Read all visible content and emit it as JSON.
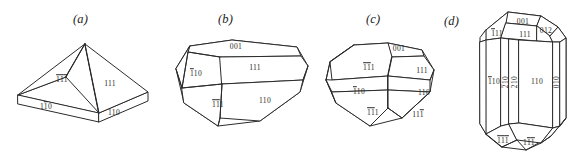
{
  "figure": {
    "background_color": "#ffffff",
    "line_color": "#2b2b2b",
    "text_color": "#2b2b2b",
    "width": 575,
    "height": 159
  },
  "panels": [
    {
      "id": "a",
      "caption": "(a)",
      "description": "Tabular crystal: square pyramid on a thin rectangular slab base",
      "labels": [
        {
          "id": "a-111bar",
          "text": "111",
          "overbars": [
            0,
            1,
            2
          ],
          "display": "1̄1̄1̄",
          "x": 62,
          "y": 80,
          "rotated": false
        },
        {
          "id": "a-111",
          "text": "111",
          "overbars": [],
          "display": "111",
          "x": 110,
          "y": 84,
          "rotated": false
        },
        {
          "id": "a-110bar",
          "text": "110",
          "overbars": [
            1
          ],
          "display": "11̄0",
          "x": 46,
          "y": 107,
          "rotated": false
        },
        {
          "id": "a-110",
          "text": "110",
          "overbars": [],
          "display": "110",
          "x": 114,
          "y": 113,
          "rotated": false
        }
      ]
    },
    {
      "id": "b",
      "caption": "(b)",
      "description": "Elongated hexagonal prismatic crystal with beveled terminations",
      "labels": [
        {
          "id": "b-001",
          "text": "001",
          "overbars": [],
          "display": "001",
          "x": 236,
          "y": 47,
          "rotated": false
        },
        {
          "id": "b-110bar",
          "text": "110",
          "overbars": [
            0
          ],
          "display": "1̄10",
          "x": 196,
          "y": 74,
          "rotated": false
        },
        {
          "id": "b-111",
          "text": "111",
          "overbars": [],
          "display": "111",
          "x": 255,
          "y": 68,
          "rotated": false
        },
        {
          "id": "b-111bar",
          "text": "111",
          "overbars": [
            0,
            1
          ],
          "display": "1̄1̄1",
          "x": 218,
          "y": 105,
          "rotated": false
        },
        {
          "id": "b-110",
          "text": "110",
          "overbars": [],
          "display": "110",
          "x": 265,
          "y": 101,
          "rotated": false
        }
      ]
    },
    {
      "id": "c",
      "caption": "(c)",
      "description": "Equant dipyramidal crystal with prism and pyramid faces",
      "labels": [
        {
          "id": "c-001",
          "text": "001",
          "overbars": [],
          "display": "001",
          "x": 399,
          "y": 49,
          "rotated": false
        },
        {
          "id": "c-111bar",
          "text": "111",
          "overbars": [
            0,
            1
          ],
          "display": "1̄1̄1",
          "x": 369,
          "y": 68,
          "rotated": false
        },
        {
          "id": "c-111",
          "text": "111",
          "overbars": [],
          "display": "111",
          "x": 422,
          "y": 71,
          "rotated": false
        },
        {
          "id": "c-110bar",
          "text": "110",
          "overbars": [
            0
          ],
          "display": "1̄10",
          "x": 359,
          "y": 92,
          "rotated": false
        },
        {
          "id": "c-110",
          "text": "110",
          "overbars": [],
          "display": "110",
          "x": 424,
          "y": 93,
          "rotated": false
        },
        {
          "id": "c-111bb",
          "text": "111",
          "overbars": [
            0,
            1
          ],
          "display": "1̄1̄1",
          "x": 373,
          "y": 113,
          "rotated": false
        },
        {
          "id": "c-11bar1",
          "text": "111",
          "overbars": [
            2
          ],
          "display": "111̄",
          "x": 418,
          "y": 115,
          "rotated": false
        }
      ]
    },
    {
      "id": "d",
      "caption": "(d)",
      "description": "Long prismatic crystal with {210} prism faces and complex terminations",
      "labels": [
        {
          "id": "d-001",
          "text": "001",
          "overbars": [],
          "display": "001",
          "x": 523,
          "y": 22,
          "rotated": false
        },
        {
          "id": "d-012",
          "text": "012",
          "overbars": [],
          "display": "012",
          "x": 546,
          "y": 31,
          "rotated": false
        },
        {
          "id": "d-111bar",
          "text": "111",
          "overbars": [
            0
          ],
          "display": "1̄11",
          "x": 497,
          "y": 34,
          "rotated": false
        },
        {
          "id": "d-111",
          "text": "111",
          "overbars": [],
          "display": "111",
          "x": 525,
          "y": 35,
          "rotated": false
        },
        {
          "id": "d-110bar",
          "text": "110",
          "overbars": [
            0
          ],
          "display": "1̄10",
          "x": 494,
          "y": 82,
          "rotated": false
        },
        {
          "id": "d-210bar",
          "text": "210",
          "overbars": [
            0
          ],
          "display": "2̄10",
          "x": 509,
          "y": 82,
          "rotated": true
        },
        {
          "id": "d-210",
          "text": "210",
          "overbars": [],
          "display": "210",
          "x": 522,
          "y": 82,
          "rotated": true
        },
        {
          "id": "d-110",
          "text": "110",
          "overbars": [],
          "display": "110",
          "x": 543,
          "y": 82,
          "rotated": false
        },
        {
          "id": "d-010",
          "text": "010",
          "overbars": [],
          "display": "010",
          "x": 561,
          "y": 82,
          "rotated": true
        },
        {
          "id": "d-111bbb",
          "text": "111",
          "overbars": [
            0,
            1,
            2
          ],
          "display": "1̄1̄1̄",
          "x": 503,
          "y": 141,
          "rotated": false
        },
        {
          "id": "d-11bar1bar",
          "text": "111",
          "overbars": [
            1,
            2
          ],
          "display": "11̄1̄",
          "x": 529,
          "y": 143,
          "rotated": false
        }
      ]
    }
  ]
}
